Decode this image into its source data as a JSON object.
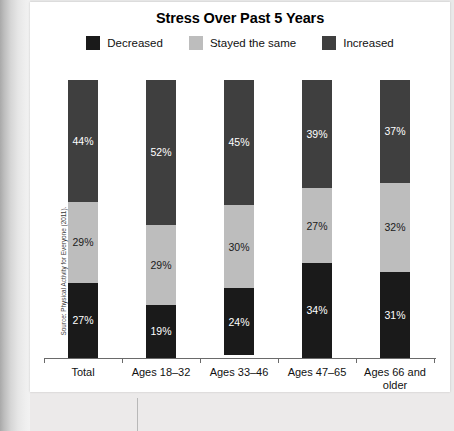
{
  "chart_data": {
    "type": "bar",
    "subtype": "stacked-100-percent-vertical",
    "title": "Stress Over Past 5 Years",
    "xlabel": "",
    "ylabel": "",
    "ylim": [
      0,
      100
    ],
    "grid": false,
    "legend_position": "top-center",
    "categories": [
      "Total",
      "Ages 18–32",
      "Ages 33–46",
      "Ages 47–65",
      "Ages 66 and older"
    ],
    "series": [
      {
        "name": "Increased",
        "color": "#3f3f3f",
        "stack_position": "top",
        "values": [
          44,
          52,
          45,
          39,
          37
        ],
        "labels": [
          "44%",
          "52%",
          "45%",
          "39%",
          "37%"
        ]
      },
      {
        "name": "Stayed the same",
        "color": "#bdbdbd",
        "stack_position": "middle",
        "values": [
          29,
          29,
          30,
          27,
          32
        ],
        "labels": [
          "29%",
          "29%",
          "30%",
          "27%",
          "32%"
        ]
      },
      {
        "name": "Decreased",
        "color": "#1a1a1a",
        "stack_position": "bottom",
        "values": [
          27,
          19,
          24,
          34,
          31
        ],
        "labels": [
          "27%",
          "19%",
          "24%",
          "34%",
          "31%"
        ]
      }
    ],
    "legend_order": [
      "Decreased",
      "Stayed the same",
      "Increased"
    ],
    "source_note": "Source: Physical Activity for Everyone (2011)."
  },
  "legend": {
    "items": [
      {
        "label": "Decreased",
        "color": "#1a1a1a"
      },
      {
        "label": "Stayed the same",
        "color": "#bdbdbd"
      },
      {
        "label": "Increased",
        "color": "#3f3f3f"
      }
    ]
  },
  "bars": [
    {
      "category": "Total",
      "category_line1": "Total",
      "category_line2": "",
      "segments": [
        {
          "series": "Increased",
          "label": "44%",
          "value": 44,
          "color": "#3f3f3f",
          "text_on": "dark"
        },
        {
          "series": "Stayed the same",
          "label": "29%",
          "value": 29,
          "color": "#bdbdbd",
          "text_on": "light"
        },
        {
          "series": "Decreased",
          "label": "27%",
          "value": 27,
          "color": "#1a1a1a",
          "text_on": "dark"
        }
      ]
    },
    {
      "category": "Ages 18–32",
      "category_line1": "Ages 18–32",
      "category_line2": "",
      "segments": [
        {
          "series": "Increased",
          "label": "52%",
          "value": 52,
          "color": "#3f3f3f",
          "text_on": "dark"
        },
        {
          "series": "Stayed the same",
          "label": "29%",
          "value": 29,
          "color": "#bdbdbd",
          "text_on": "light"
        },
        {
          "series": "Decreased",
          "label": "19%",
          "value": 19,
          "color": "#1a1a1a",
          "text_on": "dark"
        }
      ]
    },
    {
      "category": "Ages 33–46",
      "category_line1": "Ages 33–46",
      "category_line2": "",
      "segments": [
        {
          "series": "Increased",
          "label": "45%",
          "value": 45,
          "color": "#3f3f3f",
          "text_on": "dark"
        },
        {
          "series": "Stayed the same",
          "label": "30%",
          "value": 30,
          "color": "#bdbdbd",
          "text_on": "light"
        },
        {
          "series": "Decreased",
          "label": "24%",
          "value": 24,
          "color": "#1a1a1a",
          "text_on": "dark"
        }
      ]
    },
    {
      "category": "Ages 47–65",
      "category_line1": "Ages 47–65",
      "category_line2": "",
      "segments": [
        {
          "series": "Increased",
          "label": "39%",
          "value": 39,
          "color": "#3f3f3f",
          "text_on": "dark"
        },
        {
          "series": "Stayed the same",
          "label": "27%",
          "value": 27,
          "color": "#bdbdbd",
          "text_on": "light"
        },
        {
          "series": "Decreased",
          "label": "34%",
          "value": 34,
          "color": "#1a1a1a",
          "text_on": "dark"
        }
      ]
    },
    {
      "category": "Ages 66 and older",
      "category_line1": "Ages 66 and",
      "category_line2": "older",
      "segments": [
        {
          "series": "Increased",
          "label": "37%",
          "value": 37,
          "color": "#3f3f3f",
          "text_on": "dark"
        },
        {
          "series": "Stayed the same",
          "label": "32%",
          "value": 32,
          "color": "#bdbdbd",
          "text_on": "light"
        },
        {
          "series": "Decreased",
          "label": "31%",
          "value": 31,
          "color": "#1a1a1a",
          "text_on": "dark"
        }
      ]
    }
  ],
  "source": {
    "text": "Source: Physical Activity for Everyone (2011)."
  }
}
